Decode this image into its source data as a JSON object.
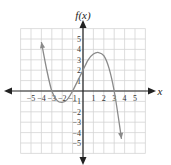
{
  "chart_data": {
    "type": "line",
    "title": "",
    "xlabel": "x",
    "ylabel": "f(x)",
    "xlim": [
      -5,
      5
    ],
    "ylim": [
      -5,
      5
    ],
    "grid": true,
    "x_ticks": [
      -5,
      -4,
      -3,
      -2,
      -1,
      1,
      2,
      3,
      4,
      5
    ],
    "y_ticks": [
      -5,
      -4,
      -3,
      -2,
      -1,
      1,
      2,
      3,
      4,
      5
    ],
    "series": [
      {
        "name": "f(x)",
        "x": [
          -4,
          -3.5,
          -3,
          -2.5,
          -2,
          -1.5,
          -1,
          -0.5,
          0,
          0.5,
          1,
          1.5,
          2,
          2.5,
          3,
          3.5,
          3.7
        ],
        "y": [
          4.7,
          2.1,
          0,
          -0.9,
          -1.1,
          -0.8,
          0,
          1,
          2,
          3,
          3.55,
          3.7,
          3.4,
          2.2,
          0,
          -3.2,
          -4.6
        ],
        "arrows": [
          "start",
          "end"
        ]
      }
    ],
    "annotations": [
      "arrow at (-4, 4.7) pointing up",
      "arrow at (3.7, -4.6) pointing down"
    ]
  },
  "labels": {
    "ylabel": "f(x)",
    "xlabel": "x"
  }
}
